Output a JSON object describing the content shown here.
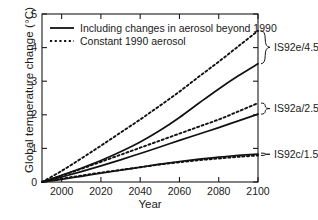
{
  "chart_data": {
    "type": "line",
    "title": "",
    "xlabel": "Year",
    "ylabel": "Global temperature change (°C)",
    "xlim": [
      1990,
      2100
    ],
    "ylim": [
      0,
      5
    ],
    "xticks": [
      2000,
      2020,
      2040,
      2060,
      2080,
      2100
    ],
    "yticks": [
      0,
      1,
      2,
      3,
      4,
      5
    ],
    "xtick_labels": [
      "2000",
      "2020",
      "2040",
      "2060",
      "2080",
      "2100"
    ],
    "ytick_labels": [
      "0",
      "1",
      "2",
      "3",
      "4",
      "5"
    ],
    "grid": false,
    "legend_position": "upper-left",
    "legend": [
      {
        "key": "solid",
        "label": "Including changes in aerosol beyond 1990",
        "style": "solid"
      },
      {
        "key": "dashed",
        "label": "Constant 1990 aerosol",
        "style": "dashed"
      }
    ],
    "x": [
      1990,
      2000,
      2010,
      2020,
      2030,
      2040,
      2050,
      2060,
      2070,
      2080,
      2090,
      2100
    ],
    "series": [
      {
        "name": "IS92e constant 1990 aerosol",
        "scenario": "IS92e/4.5",
        "style": "dashed",
        "values": [
          0,
          0.33,
          0.7,
          1.08,
          1.47,
          1.86,
          2.27,
          2.69,
          3.14,
          3.58,
          4.04,
          4.5
        ]
      },
      {
        "name": "IS92e including aerosol changes",
        "scenario": "IS92e/4.5",
        "style": "solid",
        "values": [
          0,
          0.2,
          0.41,
          0.64,
          0.9,
          1.19,
          1.53,
          1.92,
          2.35,
          2.77,
          3.16,
          3.52
        ]
      },
      {
        "name": "IS92a constant 1990 aerosol",
        "scenario": "IS92a/2.5",
        "style": "dashed",
        "values": [
          0,
          0.19,
          0.39,
          0.6,
          0.81,
          1.02,
          1.23,
          1.44,
          1.65,
          1.86,
          2.1,
          2.35
        ]
      },
      {
        "name": "IS92a including aerosol changes",
        "scenario": "IS92a/2.5",
        "style": "solid",
        "values": [
          0,
          0.15,
          0.31,
          0.48,
          0.66,
          0.85,
          1.04,
          1.24,
          1.43,
          1.62,
          1.82,
          2.02
        ]
      },
      {
        "name": "IS92c constant 1990 aerosol",
        "scenario": "IS92c/1.5",
        "style": "dashed",
        "values": [
          0,
          0.1,
          0.19,
          0.28,
          0.36,
          0.44,
          0.52,
          0.59,
          0.65,
          0.7,
          0.75,
          0.79
        ]
      },
      {
        "name": "IS92c including aerosol changes",
        "scenario": "IS92c/1.5",
        "style": "solid",
        "values": [
          0,
          0.08,
          0.17,
          0.26,
          0.35,
          0.44,
          0.53,
          0.61,
          0.68,
          0.74,
          0.79,
          0.83
        ]
      }
    ],
    "annotations": [
      {
        "label": "IS92e/4.5",
        "range": [
          3.52,
          4.5
        ]
      },
      {
        "label": "IS92a/2.5",
        "range": [
          2.02,
          2.35
        ]
      },
      {
        "label": "IS92c/1.5",
        "range": [
          0.79,
          0.86
        ]
      }
    ]
  }
}
